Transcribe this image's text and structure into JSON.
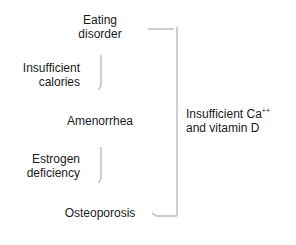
{
  "diagram": {
    "nodes": [
      {
        "id": "eating-disorder",
        "line1": "Eating",
        "line2": "disorder"
      },
      {
        "id": "amenorrhea",
        "line1": "Amenorrhea"
      },
      {
        "id": "osteoporosis",
        "line1": "Osteoporosis"
      }
    ],
    "edge_labels": {
      "insufficient_calories": {
        "line1": "Insufficient",
        "line2": "calories"
      },
      "estrogen_deficiency": {
        "line1": "Estrogen",
        "line2": "deficiency"
      },
      "insufficient_ca": {
        "line1_main": "Insufficient Ca",
        "line1_sup": "++",
        "line2": "and vitamin D"
      }
    },
    "edges": [
      {
        "from": "eating-disorder",
        "to": "amenorrhea",
        "label": "Insufficient calories"
      },
      {
        "from": "amenorrhea",
        "to": "osteoporosis",
        "label": "Estrogen deficiency"
      },
      {
        "from": "eating-disorder",
        "to": "osteoporosis",
        "label": "Insufficient Ca++ and vitamin D"
      }
    ],
    "colors": {
      "text": "#1a1a1a",
      "arrow": "#b0b0b0"
    }
  }
}
